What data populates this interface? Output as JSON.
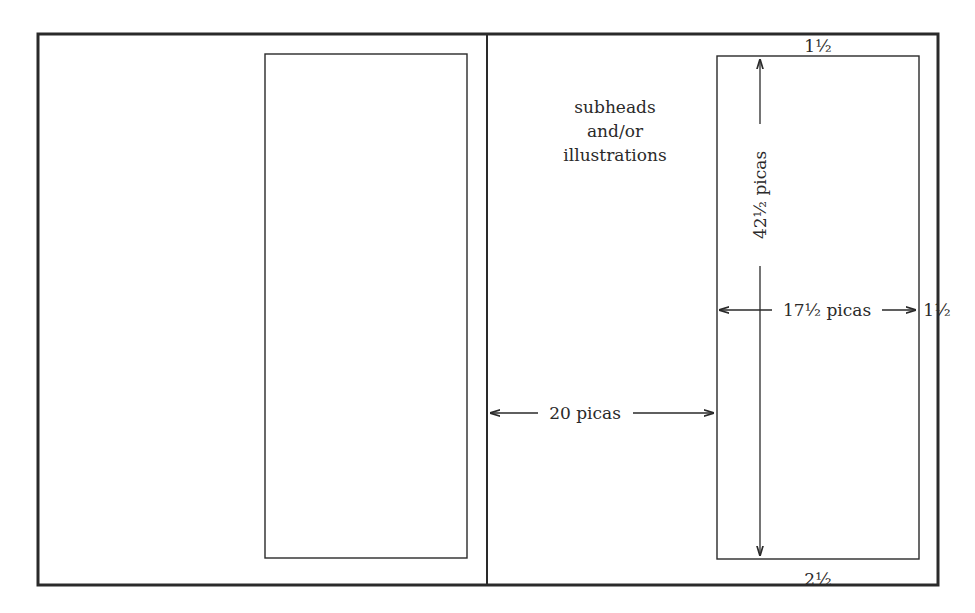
{
  "diagram": {
    "labels": {
      "subheads": [
        "subheads",
        "and/or",
        "illustrations"
      ],
      "top_margin": "1½",
      "bottom_margin": "2½",
      "outer_margin": "1½",
      "text_height": "42½ picas",
      "text_width": "17½ picas",
      "inner_margin": "20 picas"
    },
    "colors": {
      "line": "#2a2a2a",
      "background": "#ffffff"
    }
  }
}
